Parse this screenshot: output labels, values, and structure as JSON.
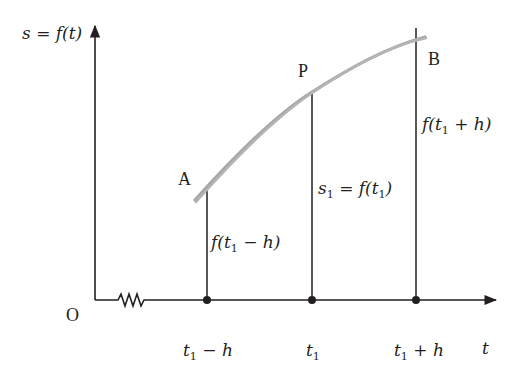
{
  "diagram": {
    "type": "secant-curve-illustration",
    "colors": {
      "axis": "#231f20",
      "curve": "#a7a7a7",
      "background": "#ffffff"
    },
    "axes": {
      "y_label": "s = f(t)",
      "x_label": "t",
      "origin_label": "O",
      "axis_break": "zigzag"
    },
    "points": [
      {
        "name": "A",
        "label": "A"
      },
      {
        "name": "P",
        "label": "P"
      },
      {
        "name": "B",
        "label": "B"
      }
    ],
    "ticks": [
      {
        "base": "t",
        "sub": "1",
        "suffix": " − h"
      },
      {
        "base": "t",
        "sub": "1",
        "suffix": ""
      },
      {
        "base": "t",
        "sub": "1",
        "suffix": " + h"
      }
    ],
    "ordinate_labels": {
      "left": {
        "pre": "f(t",
        "sub": "1",
        "post": " − h)"
      },
      "middle": {
        "pre_s": "s",
        "sub_s": "1",
        "eq": " = f(t",
        "sub": "1",
        "post": ")"
      },
      "right": {
        "pre": "f(t",
        "sub": "1",
        "post": " + h)"
      }
    }
  }
}
